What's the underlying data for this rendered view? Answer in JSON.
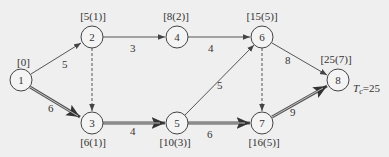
{
  "diagram": {
    "type": "activity-network",
    "colors": {
      "background": "#efefef",
      "stroke": "#444444",
      "critical": "#555555"
    },
    "nodes": [
      {
        "id": "1",
        "label": "1",
        "x": 21,
        "y": 80,
        "time": "[0]"
      },
      {
        "id": "2",
        "label": "2",
        "x": 92,
        "y": 37,
        "time": "[5(1)]"
      },
      {
        "id": "3",
        "label": "3",
        "x": 92,
        "y": 123,
        "time": "[6(1)]"
      },
      {
        "id": "4",
        "label": "4",
        "x": 177,
        "y": 37,
        "time": "[8(2)]"
      },
      {
        "id": "5",
        "label": "5",
        "x": 177,
        "y": 123,
        "time": "[10(3)]"
      },
      {
        "id": "6",
        "label": "6",
        "x": 262,
        "y": 37,
        "time": "[15(5)]"
      },
      {
        "id": "7",
        "label": "7",
        "x": 262,
        "y": 123,
        "time": "[16(5)]"
      },
      {
        "id": "8",
        "label": "8",
        "x": 338,
        "y": 80,
        "time": "[25(7)]"
      }
    ],
    "edges": [
      {
        "from": "1",
        "to": "2",
        "duration": "5",
        "style": "normal"
      },
      {
        "from": "1",
        "to": "3",
        "duration": "6",
        "style": "critical"
      },
      {
        "from": "2",
        "to": "3",
        "duration": "",
        "style": "dummy"
      },
      {
        "from": "2",
        "to": "4",
        "duration": "3",
        "style": "normal"
      },
      {
        "from": "3",
        "to": "5",
        "duration": "4",
        "style": "critical"
      },
      {
        "from": "4",
        "to": "6",
        "duration": "4",
        "style": "normal"
      },
      {
        "from": "5",
        "to": "6",
        "duration": "5",
        "style": "normal"
      },
      {
        "from": "5",
        "to": "7",
        "duration": "6",
        "style": "critical"
      },
      {
        "from": "6",
        "to": "7",
        "duration": "",
        "style": "dummy"
      },
      {
        "from": "6",
        "to": "8",
        "duration": "8",
        "style": "normal"
      },
      {
        "from": "7",
        "to": "8",
        "duration": "9",
        "style": "critical"
      }
    ],
    "total_time_label": {
      "symbol": "T",
      "subscript": "c",
      "value": "=25"
    }
  }
}
